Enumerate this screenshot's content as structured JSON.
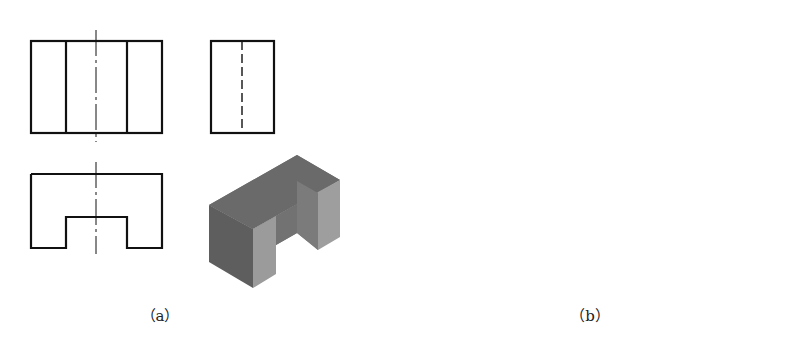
{
  "figure": {
    "panels": [
      {
        "id": "a",
        "caption": "（a）",
        "cutout_shape": "rectangular notch",
        "views": [
          "front-view",
          "side-view",
          "top-view",
          "isometric-view"
        ]
      },
      {
        "id": "b",
        "caption": "（b）",
        "cutout_shape": "semicircular notch",
        "views": [
          "front-view",
          "side-view",
          "top-view",
          "isometric-view"
        ]
      }
    ]
  },
  "colors": {
    "line": "#111111",
    "background": "#ffffff",
    "solid_top": "#6b6b6b",
    "solid_left": "#5c5c5c",
    "solid_front": "#9a9a9a",
    "solid_inner": "#b5b5b5"
  }
}
